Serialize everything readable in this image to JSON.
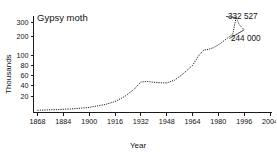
{
  "chart_data": {
    "type": "line",
    "title": "Gypsy moth",
    "xlabel": "Year",
    "ylabel": "Thousands",
    "grid": false,
    "legend": null,
    "y_scale": "segmented (linear 0-100, compressed above 100)",
    "y_ticks": [
      20,
      40,
      60,
      80,
      100,
      200,
      300
    ],
    "y_tick_labels": [
      "20",
      "40",
      "60",
      "80",
      "100",
      "200",
      "300"
    ],
    "ylim": [
      0,
      340
    ],
    "x_ticks": [
      1868,
      1884,
      1900,
      1916,
      1932,
      1948,
      1964,
      1980,
      1996,
      2004
    ],
    "x_tick_labels": [
      "1868",
      "1884",
      "1900",
      "1916",
      "1932",
      "1948",
      "1964",
      "1980",
      "1996",
      "2004"
    ],
    "xlim": [
      1868,
      2004
    ],
    "x": [
      1868,
      1880,
      1890,
      1900,
      1910,
      1916,
      1922,
      1928,
      1932,
      1936,
      1941,
      1948,
      1953,
      1958,
      1964,
      1968,
      1971,
      1974,
      1977,
      1981,
      1985,
      1989,
      1991,
      1993,
      1996
    ],
    "values": [
      1,
      2,
      3,
      5,
      9,
      13,
      20,
      33,
      46,
      47,
      45,
      44,
      50,
      62,
      80,
      101,
      128,
      132,
      140,
      160,
      185,
      215,
      332.527,
      280,
      244
    ],
    "series": [
      {
        "name": "Gypsy moth",
        "values": [
          1,
          2,
          3,
          5,
          9,
          13,
          20,
          33,
          46,
          47,
          45,
          44,
          50,
          62,
          80,
          101,
          128,
          132,
          140,
          160,
          185,
          215,
          332.527,
          280,
          244
        ]
      }
    ],
    "annotations": [
      {
        "label": "332 527",
        "x": 1991,
        "y": 332.527
      },
      {
        "label": "244 000",
        "x": 1996,
        "y": 244
      }
    ]
  }
}
